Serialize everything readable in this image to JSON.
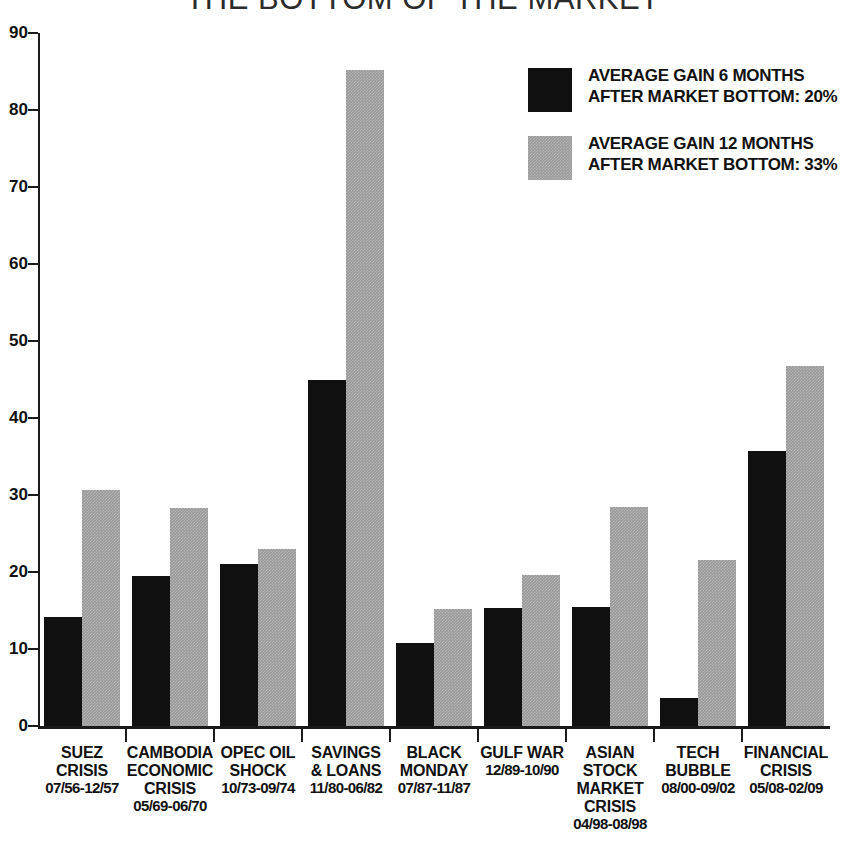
{
  "title": "THE BOTTOM OF THE MARKET",
  "legend": [
    {
      "swatch": "black",
      "color": "#111111",
      "line1": "AVERAGE GAIN 6 MONTHS",
      "line2": "AFTER MARKET BOTTOM: 20%"
    },
    {
      "swatch": "grey",
      "color": "#9a9a9a",
      "line1": "AVERAGE GAIN 12 MONTHS",
      "line2": "AFTER MARKET BOTTOM: 33%"
    }
  ],
  "yaxis": {
    "ticks": [
      "0",
      "10",
      "20",
      "30",
      "40",
      "50",
      "60",
      "70",
      "80",
      "90"
    ]
  },
  "categories": [
    {
      "name": "SUEZ\nCRISIS",
      "range": "07/56-12/57"
    },
    {
      "name": "CAMBODIA\nECONOMIC\nCRISIS",
      "range": "05/69-06/70"
    },
    {
      "name": "OPEC OIL\nSHOCK",
      "range": "10/73-09/74"
    },
    {
      "name": "SAVINGS\n& LOANS",
      "range": "11/80-06/82"
    },
    {
      "name": "BLACK\nMONDAY",
      "range": "07/87-11/87"
    },
    {
      "name": "GULF WAR",
      "range": "12/89-10/90"
    },
    {
      "name": "ASIAN\nSTOCK\nMARKET\nCRISIS",
      "range": "04/98-08/98"
    },
    {
      "name": "TECH\nBUBBLE",
      "range": "08/00-09/02"
    },
    {
      "name": "FINANCIAL\nCRISIS",
      "range": "05/08-02/09"
    }
  ],
  "chart_data": {
    "type": "bar",
    "title": "THE BOTTOM OF THE MARKET",
    "xlabel": "",
    "ylabel": "",
    "ylim": [
      0,
      90
    ],
    "ytick_step": 10,
    "grid": false,
    "legend_position": "top-right",
    "categories": [
      "SUEZ CRISIS 07/56-12/57",
      "CAMBODIA ECONOMIC CRISIS 05/69-06/70",
      "OPEC OIL SHOCK 10/73-09/74",
      "SAVINGS & LOANS 11/80-06/82",
      "BLACK MONDAY 07/87-11/87",
      "GULF WAR 12/89-10/90",
      "ASIAN STOCK MARKET CRISIS 04/98-08/98",
      "TECH BUBBLE 08/00-09/02",
      "FINANCIAL CRISIS 05/08-02/09"
    ],
    "series": [
      {
        "name": "AVERAGE GAIN 6 MONTHS AFTER MARKET BOTTOM: 20%",
        "color": "#111111",
        "values": [
          14.2,
          19.5,
          21.1,
          45.0,
          10.8,
          15.3,
          15.5,
          3.6,
          35.7
        ]
      },
      {
        "name": "AVERAGE GAIN 12 MONTHS AFTER MARKET BOTTOM: 33%",
        "color": "#9a9a9a",
        "values": [
          30.7,
          28.3,
          23.0,
          85.2,
          15.2,
          19.6,
          28.4,
          21.6,
          46.7
        ]
      }
    ]
  }
}
